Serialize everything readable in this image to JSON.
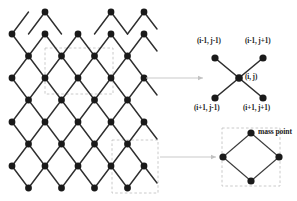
{
  "figure": {
    "type": "lattice-stencil-diagram",
    "background_color": "#ffffff",
    "node_color": "#1a1a1a",
    "edge_color": "#2b2b2b",
    "dashed_box_color": "#b8b8b8",
    "arrow_color": "#c2c2c2"
  },
  "lattice": {
    "name": "quadrilateral mass-spring lattice",
    "rows": 9,
    "columns": 5,
    "node_radius": 3.3,
    "cell_width": 33,
    "cell_height": 22,
    "origin_x": 12,
    "origin_y": 12,
    "highlight_boxes": [
      {
        "x": 45,
        "y": 48,
        "width": 68,
        "height": 46
      },
      {
        "x": 112,
        "y": 140,
        "width": 46,
        "height": 52
      }
    ]
  },
  "stencil": {
    "title": "five-point stencil",
    "center": {
      "label_prefix": "(",
      "i": "i",
      "comma": ", ",
      "j": "j",
      "label_suffix": ")"
    },
    "center_label": "(i, j)",
    "nodes": [
      {
        "position": "top-left",
        "label": "(i-1, j-1)"
      },
      {
        "position": "top-right",
        "label": "(i-1, j+1)"
      },
      {
        "position": "center",
        "label": "(i, j)"
      },
      {
        "position": "bottom-left",
        "label": "(i+1, j-1)"
      },
      {
        "position": "bottom-right",
        "label": "(i+1, j+1)"
      }
    ],
    "labels": {
      "top_left": "(i-1, j-1)",
      "top_right": "(i-1, j+1)",
      "center": "(i, j)",
      "bottom_left": "(i+1, j-1)",
      "bottom_right": "(i+1, j+1)"
    }
  },
  "cell_detail": {
    "title": "mass point",
    "mass_point_label": "mass point",
    "shape": "diamond",
    "node_count": 4
  },
  "annotations": {
    "arrow_upper": "callout arrow from lattice to stencil diagram",
    "arrow_lower": "callout arrow from lattice to unit cell diagram"
  }
}
